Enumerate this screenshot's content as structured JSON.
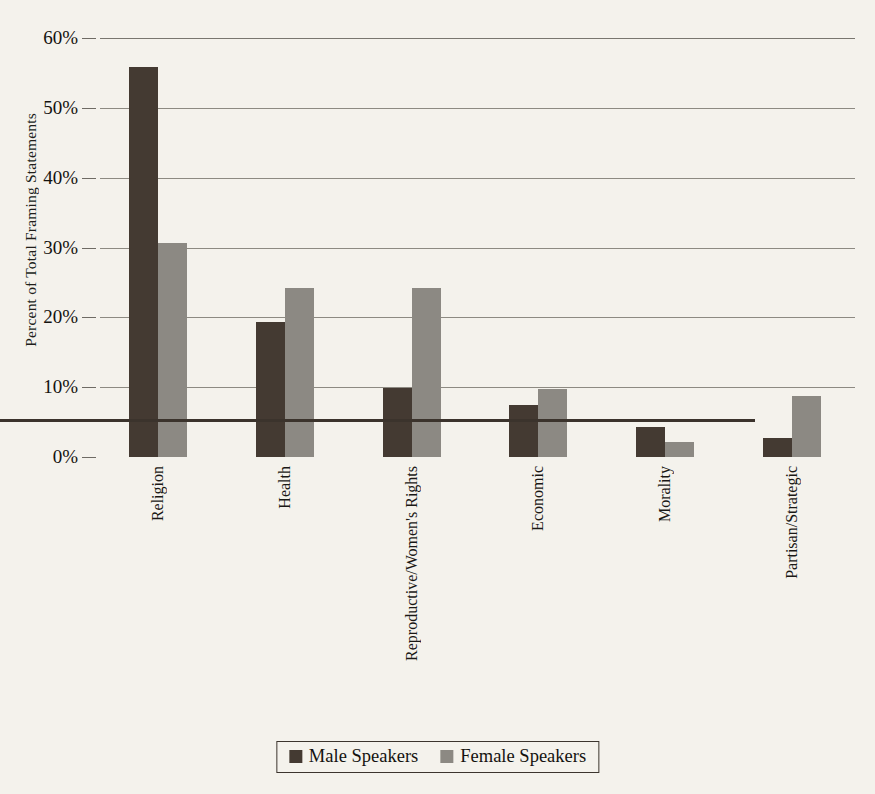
{
  "chart_data": {
    "type": "bar",
    "title": "",
    "subtitle": "",
    "xlabel": "",
    "ylabel": "Percent of Total Framing Statements",
    "ylim": [
      0,
      60
    ],
    "ytick_labels": [
      "0%",
      "10%",
      "20%",
      "30%",
      "40%",
      "50%",
      "60%"
    ],
    "ytick_values": [
      0,
      10,
      20,
      30,
      40,
      50,
      60
    ],
    "grid": true,
    "legend_position": "bottom-center",
    "categories": [
      "Religion",
      "Health",
      "Reproductive/Women's Rights",
      "Economic",
      "Morality",
      "Partisan/Strategic"
    ],
    "series": [
      {
        "name": "Male Speakers",
        "color": "#443a32",
        "values": [
          55.8,
          19.4,
          9.9,
          7.5,
          4.3,
          2.7
        ]
      },
      {
        "name": "Female Speakers",
        "color": "#8c8983",
        "values": [
          30.6,
          24.2,
          24.2,
          9.8,
          2.1,
          8.8
        ]
      }
    ],
    "colors": {
      "background": "#f4f2ec",
      "male": "#443a32",
      "female": "#8c8983",
      "axis": "#3b332c",
      "grid": "#8d8a82",
      "text": "#14120f"
    }
  },
  "legend": {
    "entries": [
      {
        "label": "Male Speakers"
      },
      {
        "label": "Female Speakers"
      }
    ]
  }
}
